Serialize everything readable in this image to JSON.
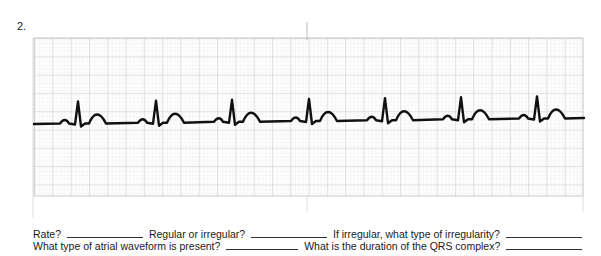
{
  "item_number": "2.",
  "ecg_strip": {
    "grid_color_minor": "#e2e2e2",
    "grid_color_major": "#b9b9b9",
    "trace_color": "#111111",
    "large_boxes_horizontal": 30,
    "r_peak_x_positions": [
      78,
      156,
      232,
      309,
      385,
      461,
      537
    ],
    "rhythm_description": "regular sinus rhythm with upright P waves, narrow QRS, upright T waves"
  },
  "questions": {
    "rate": "Rate?",
    "regularity": "Regular or irregular?",
    "irregularity_type": "If irregular, what type of irregularity?",
    "atrial_waveform": "What type of atrial waveform is present?",
    "qrs_duration": "What is the duration of the QRS complex?"
  }
}
